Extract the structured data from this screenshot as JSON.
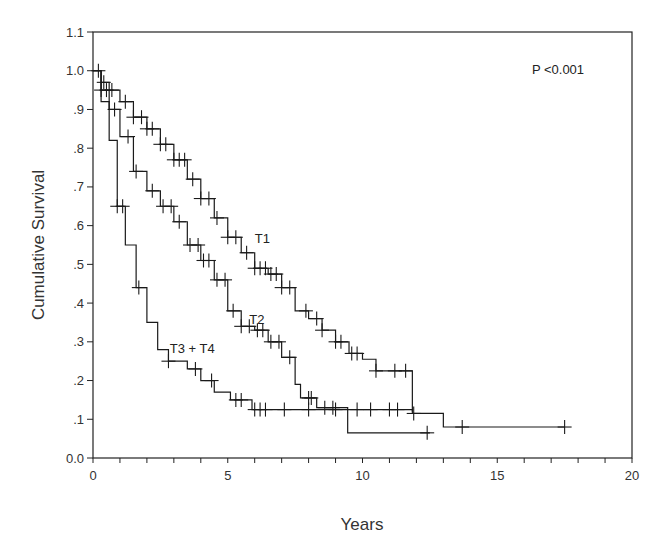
{
  "chart_data": {
    "type": "line",
    "subtype": "kaplan-meier-step",
    "title": "",
    "xlabel": "Years",
    "ylabel": "Cumulative Survival",
    "xlim": [
      0,
      20
    ],
    "ylim": [
      0.0,
      1.1
    ],
    "x_ticks": [
      0,
      5,
      10,
      15,
      20
    ],
    "x_minor_tick_step": 1,
    "y_ticks": [
      1.1,
      1.0,
      0.9,
      0.8,
      0.7,
      0.6,
      0.5,
      0.4,
      0.3,
      0.2,
      0.1,
      0.0
    ],
    "y_tick_labels": [
      "1.1",
      "1.0",
      ".9",
      ".8",
      ".7",
      ".6",
      ".5",
      ".4",
      ".3",
      ".2",
      ".1",
      "0.0"
    ],
    "x_tick_labels": [
      "0",
      "5",
      "10",
      "15",
      "20"
    ],
    "grid": false,
    "legend": "none (inline series labels)",
    "annotations": [
      {
        "text": "P <0.001",
        "x": 17.2,
        "y": 1.0
      }
    ],
    "series": [
      {
        "name": "T1",
        "label_pos": [
          6.0,
          0.555
        ],
        "x": [
          0,
          0.3,
          0.6,
          1.0,
          1.5,
          2.0,
          2.5,
          3.0,
          3.5,
          4.0,
          4.5,
          5.0,
          5.5,
          6.0,
          6.5,
          7.0,
          7.5,
          8.0,
          8.5,
          9.0,
          9.5,
          10.0,
          10.5,
          11.85,
          13.0,
          17.5
        ],
        "values": [
          1.0,
          0.97,
          0.95,
          0.92,
          0.88,
          0.85,
          0.81,
          0.77,
          0.72,
          0.67,
          0.62,
          0.57,
          0.53,
          0.49,
          0.475,
          0.44,
          0.38,
          0.36,
          0.33,
          0.3,
          0.27,
          0.255,
          0.225,
          0.115,
          0.08,
          0.08
        ],
        "censored_x": [
          0.4,
          0.7,
          1.2,
          1.5,
          1.8,
          2.0,
          2.2,
          2.5,
          2.7,
          3.0,
          3.2,
          3.4,
          3.7,
          4.0,
          4.3,
          4.6,
          5.0,
          5.3,
          5.7,
          6.0,
          6.2,
          6.4,
          6.6,
          6.8,
          7.0,
          7.3,
          7.9,
          8.3,
          8.5,
          9.0,
          9.2,
          9.6,
          9.8,
          10.5,
          11.2,
          11.6,
          11.9,
          13.7,
          17.5
        ]
      },
      {
        "name": "T2",
        "label_pos": [
          5.8,
          0.345
        ],
        "x": [
          0,
          0.3,
          0.6,
          1.0,
          1.5,
          2.0,
          2.5,
          3.0,
          3.5,
          4.0,
          4.5,
          5.0,
          5.5,
          6.0,
          6.5,
          7.0,
          7.5,
          7.7,
          8.3,
          9.45,
          12.5
        ],
        "values": [
          1.0,
          0.95,
          0.9,
          0.83,
          0.74,
          0.69,
          0.65,
          0.61,
          0.55,
          0.51,
          0.46,
          0.38,
          0.34,
          0.33,
          0.3,
          0.26,
          0.19,
          0.155,
          0.13,
          0.065,
          0.065
        ],
        "censored_x": [
          0.3,
          0.5,
          0.8,
          1.3,
          1.6,
          2.2,
          2.6,
          2.9,
          3.2,
          3.6,
          3.9,
          4.1,
          4.3,
          4.6,
          4.9,
          5.2,
          5.5,
          5.8,
          6.1,
          6.3,
          6.6,
          6.9,
          7.3,
          8.0,
          8.1,
          8.6,
          8.9,
          12.4
        ]
      },
      {
        "name": "T3 + T4",
        "label_pos": [
          2.85,
          0.27
        ],
        "x": [
          0,
          0.3,
          0.6,
          0.9,
          1.2,
          1.6,
          2.0,
          2.4,
          2.8,
          3.5,
          4.0,
          4.5,
          5.1,
          5.9,
          11.85
        ],
        "values": [
          1.0,
          0.92,
          0.82,
          0.65,
          0.55,
          0.44,
          0.35,
          0.28,
          0.25,
          0.23,
          0.2,
          0.17,
          0.15,
          0.125,
          0.12
        ],
        "censored_x": [
          0.2,
          0.9,
          1.1,
          1.7,
          2.8,
          3.8,
          4.4,
          5.3,
          5.5,
          6.0,
          6.2,
          6.4,
          7.1,
          8.0,
          9.0,
          9.8,
          10.3,
          11.0,
          11.3
        ]
      }
    ]
  },
  "labels": {
    "ylabel": "Cumulative Survival",
    "xlabel": "Years",
    "pvalue": "P <0.001"
  }
}
